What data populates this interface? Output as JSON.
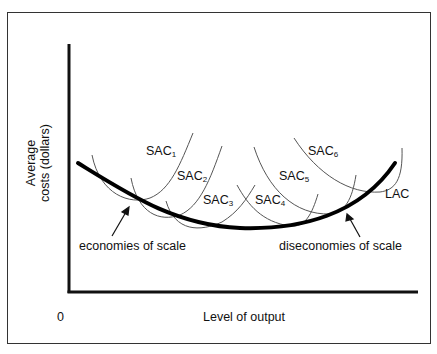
{
  "diagram": {
    "axes": {
      "y_label_line1": "Average",
      "y_label_line2": "costs (dollars)",
      "x_label": "Level of output",
      "origin": "0"
    },
    "curves": {
      "lac_label": "LAC",
      "sac": [
        {
          "base": "SAC",
          "sub": "1"
        },
        {
          "base": "SAC",
          "sub": "2"
        },
        {
          "base": "SAC",
          "sub": "3"
        },
        {
          "base": "SAC",
          "sub": "4"
        },
        {
          "base": "SAC",
          "sub": "5"
        },
        {
          "base": "SAC",
          "sub": "6"
        }
      ]
    },
    "annotations": {
      "left": "economies of scale",
      "right": "diseconomies of scale"
    }
  }
}
